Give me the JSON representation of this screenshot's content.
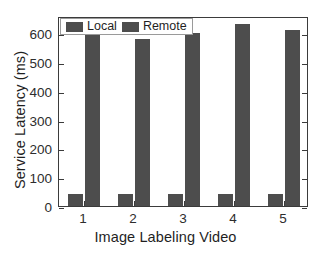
{
  "chart_data": {
    "type": "bar",
    "title": "",
    "xlabel": "Image Labeling Video",
    "ylabel": "Service Latency (ms)",
    "categories": [
      "1",
      "2",
      "3",
      "4",
      "5"
    ],
    "series": [
      {
        "name": "Local",
        "values": [
          42,
          42,
          42,
          42,
          42
        ],
        "color": "#4d4d4d"
      },
      {
        "name": "Remote",
        "values": [
          600,
          580,
          600,
          632,
          610
        ],
        "color": "#4d4d4d"
      }
    ],
    "ylim": [
      0,
      660
    ],
    "yticks": [
      0,
      100,
      200,
      300,
      400,
      500,
      600
    ],
    "ytick_labels": [
      "0",
      "100",
      "200",
      "300",
      "400",
      "500",
      "600"
    ],
    "grid": false,
    "legend": {
      "position": "top-left-inside",
      "entries": [
        "Local",
        "Remote"
      ]
    },
    "axes": {
      "box": true,
      "tick_direction": "in",
      "line_color": "#3b3b3b"
    }
  }
}
